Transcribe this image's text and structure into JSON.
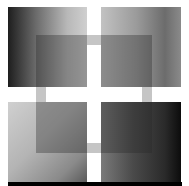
{
  "artwork": {
    "description": "Abstract grayscale composition: four gradient squares with an overlapping translucent square frame",
    "colors": {
      "background": "#ffffff",
      "darkest": "#0c0c0c",
      "lightest": "#d0d0d0",
      "frame_band": "#969696",
      "bottom_bar": "#000000"
    },
    "quadrants": [
      {
        "position": "top-left",
        "gradient": "dark left to light right"
      },
      {
        "position": "top-right",
        "gradient": "light left to dark right"
      },
      {
        "position": "bottom-left",
        "gradient": "light top-left to dark bottom-right"
      },
      {
        "position": "bottom-right",
        "gradient": "mid gray left to near black right"
      }
    ]
  }
}
